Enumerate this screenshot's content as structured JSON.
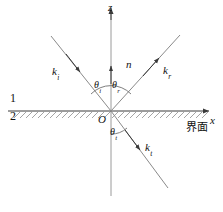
{
  "figure": {
    "kind": "optics-reflection-refraction-diagram",
    "stroke_color": "#3a3a3a",
    "text_color": "#111111",
    "background": "#ffffff"
  },
  "axes": {
    "vertical_label": "z",
    "horizontal_label": "x",
    "origin_label": "O"
  },
  "normal": {
    "label": "n"
  },
  "vectors": [
    {
      "name": "incident",
      "symbol": "k",
      "subscript": "i"
    },
    {
      "name": "reflected",
      "symbol": "k",
      "subscript": "r"
    },
    {
      "name": "transmitted",
      "symbol": "k",
      "subscript": "t"
    }
  ],
  "angles": [
    {
      "name": "incidence",
      "symbol": "θ",
      "subscript": "i"
    },
    {
      "name": "reflection",
      "symbol": "θ",
      "subscript": "r"
    },
    {
      "name": "refraction",
      "symbol": "θ",
      "subscript": "t"
    }
  ],
  "media": {
    "upper": "1",
    "lower": "2"
  },
  "interface": {
    "label": "界面"
  }
}
